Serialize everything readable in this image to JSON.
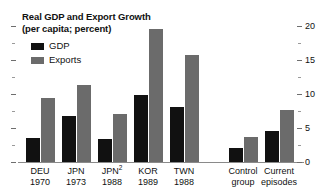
{
  "chart_data": {
    "type": "bar",
    "title": "Real GDP and Export Growth",
    "subtitle": "(per capita; percent)",
    "xlabel": "",
    "ylabel": "",
    "ylim": [
      0,
      20
    ],
    "yticks": [
      0,
      5,
      10,
      15,
      20
    ],
    "ytick_labels": [
      "0",
      "5",
      "10",
      "15",
      "20"
    ],
    "yminor_ticks": [
      2.5,
      7.5,
      12.5,
      17.5
    ],
    "grid": false,
    "legend_position": "top-left",
    "axis_position": "right",
    "categories": [
      "DEU 1970",
      "JPN 1973",
      "JPN2 1988",
      "KOR 1989",
      "TWN 1988",
      "Control group",
      "Current episodes"
    ],
    "category_labels": [
      {
        "line1": "DEU",
        "line2": "1970",
        "superscript": ""
      },
      {
        "line1": "JPN",
        "line2": "1973",
        "superscript": ""
      },
      {
        "line1": "JPN",
        "line2": "1988",
        "superscript": "2"
      },
      {
        "line1": "KOR",
        "line2": "1989",
        "superscript": ""
      },
      {
        "line1": "TWN",
        "line2": "1988",
        "superscript": ""
      },
      {
        "line1": "Control",
        "line2": "group",
        "superscript": ""
      },
      {
        "line1": "Current",
        "line2": "episodes",
        "superscript": ""
      }
    ],
    "series": [
      {
        "name": "GDP",
        "color": "#111111",
        "values": [
          3.5,
          6.8,
          3.4,
          9.9,
          8.1,
          2.1,
          4.5
        ]
      },
      {
        "name": "Exports",
        "color": "#6b6b6b",
        "values": [
          9.4,
          11.3,
          7.0,
          19.6,
          15.8,
          3.7,
          7.7
        ]
      }
    ]
  },
  "legend": {
    "items": [
      {
        "label": "GDP",
        "color": "#111111"
      },
      {
        "label": "Exports",
        "color": "#6b6b6b"
      }
    ]
  },
  "colors": {
    "gdp": "#111111",
    "exports": "#6b6b6b",
    "axis": "#8a8a8a",
    "tick": "#6e6e6e",
    "background": "#ffffff"
  }
}
